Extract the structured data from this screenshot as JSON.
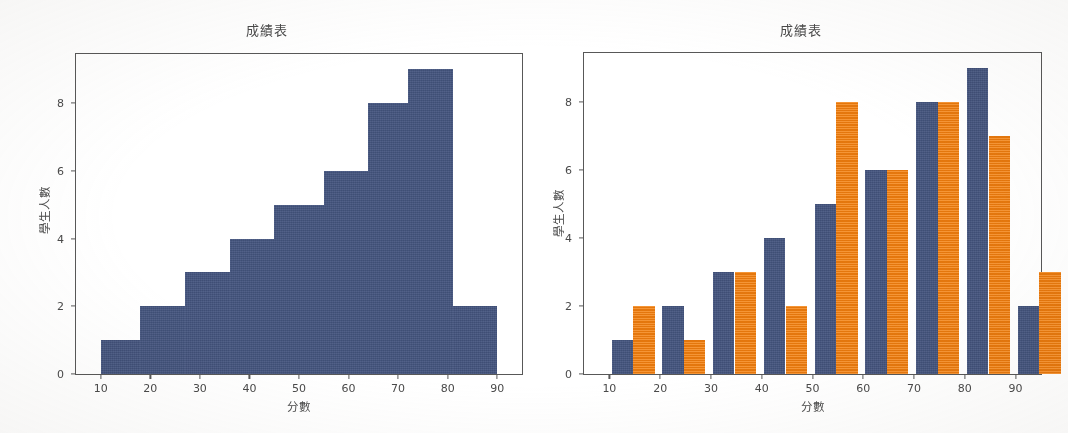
{
  "figure": {
    "background_color": "#ffffff",
    "panels": [
      {
        "id": "left",
        "title": "成績表",
        "xlabel": "分數",
        "ylabel": "學生人數"
      },
      {
        "id": "right",
        "title": "成績表",
        "xlabel": "分數",
        "ylabel": "學生人數"
      }
    ]
  },
  "colors": {
    "blue": "#44557f",
    "orange": "#f3810f",
    "axis": "#585858",
    "text": "#4a4a4a"
  },
  "chart_data": [
    {
      "type": "bar",
      "id": "histogram",
      "title": "成績表",
      "xlabel": "分數",
      "ylabel": "學生人數",
      "xlim": [
        5,
        95
      ],
      "ylim": [
        0,
        9.45
      ],
      "xticks": [
        10,
        20,
        30,
        40,
        50,
        60,
        70,
        80,
        90
      ],
      "yticks": [
        0,
        2,
        4,
        6,
        8
      ],
      "grid": false,
      "legend": "none",
      "bin_edges": [
        10,
        20,
        30,
        40,
        50,
        60,
        70,
        80,
        90
      ],
      "categories": [
        "10-20",
        "20-30",
        "30-40",
        "40-50",
        "50-60",
        "60-70",
        "70-80",
        "80-90"
      ],
      "values": [
        1,
        2,
        3,
        4,
        5,
        6,
        8,
        9
      ],
      "last_bar": {
        "range": "80-90",
        "value": 2
      },
      "bars": [
        {
          "x0": 10,
          "x1": 18,
          "value": 1
        },
        {
          "x0": 18,
          "x1": 27,
          "value": 2
        },
        {
          "x0": 27,
          "x1": 36,
          "value": 3
        },
        {
          "x0": 36,
          "x1": 45,
          "value": 4
        },
        {
          "x0": 45,
          "x1": 55,
          "value": 5
        },
        {
          "x0": 55,
          "x1": 64,
          "value": 6
        },
        {
          "x0": 64,
          "x1": 72,
          "value": 8
        },
        {
          "x0": 72,
          "x1": 81,
          "value": 9
        },
        {
          "x0": 81,
          "x1": 90,
          "value": 2
        }
      ]
    },
    {
      "type": "bar",
      "id": "grouped-bar",
      "title": "成績表",
      "xlabel": "分數",
      "ylabel": "學生人數",
      "xlim": [
        5,
        95
      ],
      "ylim": [
        0,
        9.45
      ],
      "xticks": [
        10,
        20,
        30,
        40,
        50,
        60,
        70,
        80,
        90
      ],
      "yticks": [
        0,
        2,
        4,
        6,
        8
      ],
      "grid": false,
      "legend": "none",
      "categories": [
        10,
        20,
        30,
        40,
        50,
        60,
        70,
        80,
        90
      ],
      "series": [
        {
          "name": "series-blue",
          "color": "#44557f",
          "values": [
            1,
            2,
            3,
            4,
            5,
            6,
            8,
            9,
            2
          ]
        },
        {
          "name": "series-orange",
          "color": "#f3810f",
          "values": [
            2,
            1,
            3,
            2,
            8,
            6,
            8,
            7,
            3
          ]
        }
      ]
    }
  ]
}
